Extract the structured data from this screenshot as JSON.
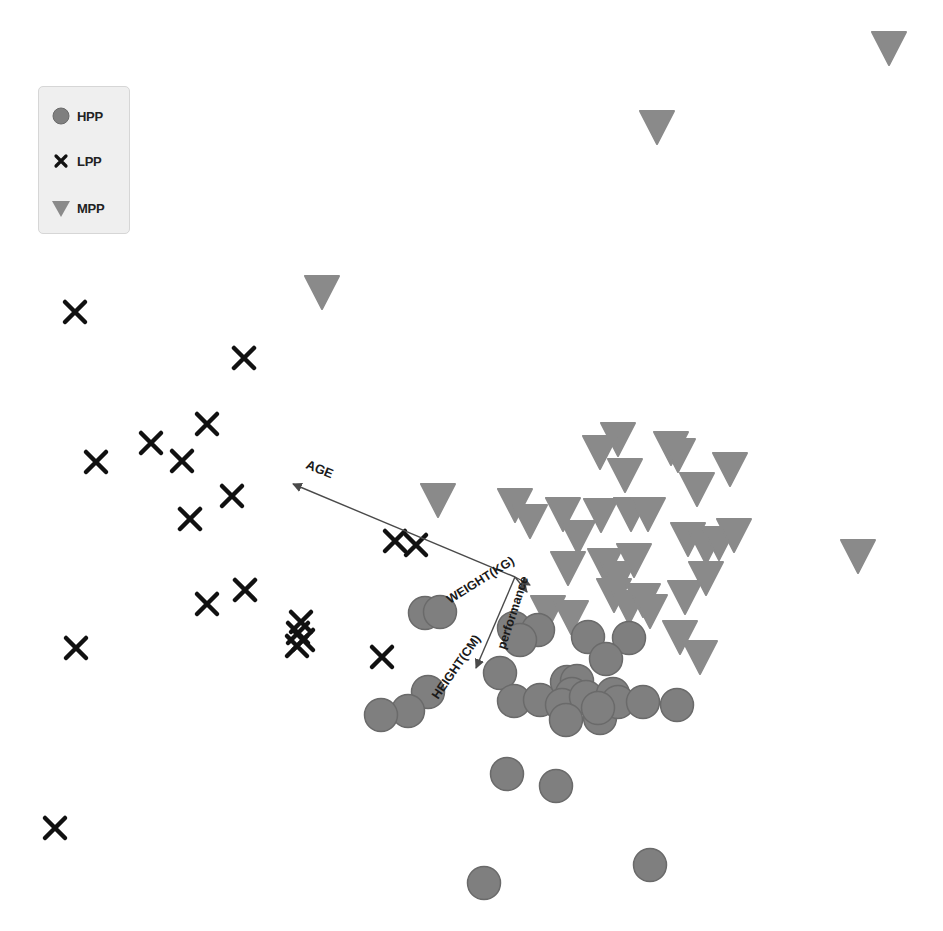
{
  "chart_data": {
    "type": "scatter",
    "subtype": "biplot",
    "title": "",
    "xlabel": "",
    "ylabel": "",
    "grid": false,
    "axes_visible": false,
    "legend_position": "upper-left",
    "legend": [
      {
        "label": "HPP",
        "marker": "circle",
        "color": "#7f7f7f"
      },
      {
        "label": "LPP",
        "marker": "x",
        "color": "#111111"
      },
      {
        "label": "MPP",
        "marker": "triangle-down",
        "color": "#8a8a8a"
      }
    ],
    "series": [
      {
        "name": "HPP",
        "marker": "circle",
        "points_px": [
          [
            425,
            613
          ],
          [
            440,
            612
          ],
          [
            514,
            628
          ],
          [
            538,
            630
          ],
          [
            520,
            640
          ],
          [
            588,
            637
          ],
          [
            629,
            638
          ],
          [
            606,
            659
          ],
          [
            500,
            673
          ],
          [
            428,
            692
          ],
          [
            408,
            711
          ],
          [
            381,
            715
          ],
          [
            514,
            701
          ],
          [
            540,
            700
          ],
          [
            567,
            682
          ],
          [
            577,
            681
          ],
          [
            572,
            694
          ],
          [
            562,
            705
          ],
          [
            586,
            697
          ],
          [
            566,
            720
          ],
          [
            600,
            718
          ],
          [
            613,
            694
          ],
          [
            618,
            702
          ],
          [
            643,
            702
          ],
          [
            677,
            705
          ],
          [
            598,
            708
          ],
          [
            507,
            774
          ],
          [
            556,
            786
          ],
          [
            484,
            883
          ],
          [
            650,
            865
          ]
        ]
      },
      {
        "name": "LPP",
        "marker": "x",
        "points_px": [
          [
            75,
            312
          ],
          [
            244,
            358
          ],
          [
            207,
            424
          ],
          [
            151,
            443
          ],
          [
            182,
            461
          ],
          [
            96,
            462
          ],
          [
            232,
            496
          ],
          [
            190,
            519
          ],
          [
            395,
            541
          ],
          [
            416,
            545
          ],
          [
            245,
            590
          ],
          [
            207,
            604
          ],
          [
            301,
            622
          ],
          [
            298,
            633
          ],
          [
            303,
            640
          ],
          [
            297,
            646
          ],
          [
            382,
            657
          ],
          [
            76,
            648
          ],
          [
            55,
            828
          ]
        ]
      },
      {
        "name": "MPP",
        "marker": "triangle-down",
        "points_px": [
          [
            889,
            48
          ],
          [
            657,
            127
          ],
          [
            322,
            292
          ],
          [
            618,
            439
          ],
          [
            600,
            452
          ],
          [
            625,
            475
          ],
          [
            671,
            448
          ],
          [
            678,
            455
          ],
          [
            730,
            469
          ],
          [
            697,
            489
          ],
          [
            438,
            500
          ],
          [
            515,
            505
          ],
          [
            530,
            521
          ],
          [
            563,
            514
          ],
          [
            578,
            537
          ],
          [
            601,
            515
          ],
          [
            631,
            514
          ],
          [
            648,
            514
          ],
          [
            688,
            539
          ],
          [
            706,
            547
          ],
          [
            719,
            543
          ],
          [
            734,
            535
          ],
          [
            858,
            556
          ],
          [
            568,
            568
          ],
          [
            605,
            565
          ],
          [
            618,
            578
          ],
          [
            634,
            560
          ],
          [
            614,
            595
          ],
          [
            629,
            607
          ],
          [
            643,
            600
          ],
          [
            650,
            611
          ],
          [
            685,
            597
          ],
          [
            706,
            578
          ],
          [
            548,
            612
          ],
          [
            571,
            617
          ],
          [
            680,
            637
          ],
          [
            700,
            657
          ]
        ]
      }
    ],
    "loadings": [
      {
        "label": "AGE",
        "from_px": [
          515,
          577
        ],
        "to_px": [
          293,
          484
        ]
      },
      {
        "label": "WEIGHT(KG)",
        "from_px": [
          515,
          577
        ],
        "to_px": [
          530,
          585
        ]
      },
      {
        "label": "performance",
        "from_px": [
          515,
          577
        ],
        "to_px": [
          527,
          592
        ]
      },
      {
        "label": "HEIGHT(CM)",
        "from_px": [
          515,
          577
        ],
        "to_px": [
          476,
          668
        ]
      }
    ]
  },
  "legend": {
    "items": [
      {
        "label": "HPP"
      },
      {
        "label": "LPP"
      },
      {
        "label": "MPP"
      }
    ]
  },
  "colors": {
    "hpp_fill": "#7f7f7f",
    "hpp_stroke": "#6a6a6a",
    "lpp": "#111111",
    "mpp_fill": "#8a8a8a",
    "arrow": "#4a4a4a",
    "label": "#1a1a1a"
  }
}
